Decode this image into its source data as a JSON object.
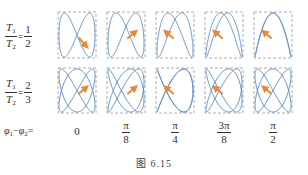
{
  "figure": {
    "caption": "图 6.15",
    "rows": [
      {
        "label_num": "T",
        "label_num_sub": "1",
        "label_den": "T",
        "label_den_sub": "2",
        "equals": "=",
        "ratio_num": "1",
        "ratio_den": "2"
      },
      {
        "label_num": "T",
        "label_num_sub": "1",
        "label_den": "T",
        "label_den_sub": "2",
        "equals": "=",
        "ratio_num": "2",
        "ratio_den": "3"
      }
    ],
    "phase_label": {
      "phi1": "φ",
      "phi1_sub": "1",
      "minus": "−",
      "phi2": "φ",
      "phi2_sub": "2",
      "equals": "="
    },
    "phases": [
      {
        "type": "plain",
        "text": "0"
      },
      {
        "type": "frac",
        "num": "π",
        "den": "8"
      },
      {
        "type": "frac",
        "num": "π",
        "den": "4"
      },
      {
        "type": "frac",
        "num": "3π",
        "den": "8"
      },
      {
        "type": "frac",
        "num": "π",
        "den": "2"
      }
    ],
    "colors": {
      "curve": "#5b8fc8",
      "arrow": "#e8893a",
      "box": "#9a9a9a"
    }
  }
}
